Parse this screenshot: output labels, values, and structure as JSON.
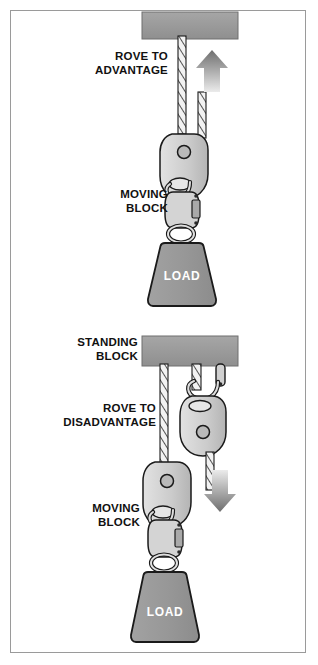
{
  "figure": {
    "border_color": "#9a9a9a",
    "background": "#ffffff"
  },
  "colors": {
    "beam_fill": "#9b9b9b",
    "beam_stroke": "#6f6f6f",
    "load_fill": "#9a9a9a",
    "load_stroke": "#1a1a1a",
    "block_fill": "#cfcfcf",
    "block_stroke": "#1a1a1a",
    "rope_fill": "#efefef",
    "rope_stroke": "#1a1a1a",
    "arrow_dark": "#6e6e6e",
    "arrow_light": "#e2e2e2",
    "text": "#111111",
    "load_text": "#ffffff"
  },
  "upper_panel": {
    "name": "rove-to-advantage",
    "arrow_direction": "up",
    "labels": {
      "system": "ROVE TO\nADVANTAGE",
      "block": "MOVING\nBLOCK",
      "load": "LOAD"
    },
    "anchor_beam": {
      "label": ""
    }
  },
  "lower_panel": {
    "name": "rove-to-disadvantage",
    "arrow_direction": "down",
    "labels": {
      "standing_block": "STANDING\nBLOCK",
      "system": "ROVE TO\nDISADVANTAGE",
      "block": "MOVING\nBLOCK",
      "load": "LOAD"
    }
  }
}
